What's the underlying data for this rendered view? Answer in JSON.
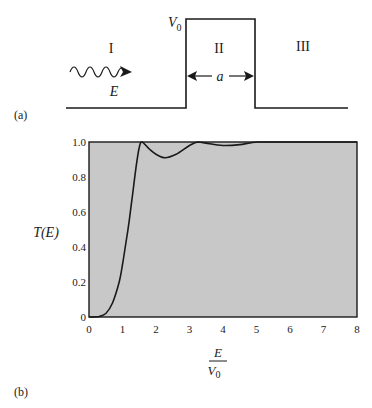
{
  "figure_a": {
    "panel_label": "(a)",
    "region_labels": [
      "I",
      "II",
      "III"
    ],
    "barrier_height_label": "V",
    "barrier_height_subscript": "0",
    "barrier_width_label": "a",
    "incident_energy_label": "E",
    "icons": {
      "incident_wave": "wavy-arrow-icon",
      "width_marker": "double-arrow-icon"
    }
  },
  "figure_b": {
    "panel_label": "(b)",
    "ylabel": "T(E)",
    "xlabel_numerator": "E",
    "xlabel_denominator": "V",
    "xlabel_denominator_subscript": "0",
    "plot_background": "#c8c8c8",
    "curve_color": "#1a1a1a"
  },
  "chart_data": {
    "type": "line",
    "title": "",
    "xlabel": "E/V0",
    "ylabel": "T(E)",
    "xlim": [
      0,
      8
    ],
    "ylim": [
      0,
      1.0
    ],
    "xticks": [
      "0",
      "1",
      "2",
      "3",
      "4",
      "5",
      "6",
      "7",
      "8"
    ],
    "yticks": [
      "0",
      "0.2",
      "0.4",
      "0.6",
      "0.8",
      "1.0"
    ],
    "grid": false,
    "legend": null,
    "series": [
      {
        "name": "T(E)",
        "x": [
          0,
          0.3,
          0.5,
          0.7,
          0.9,
          1.0,
          1.1,
          1.2,
          1.3,
          1.4,
          1.5,
          1.58,
          1.8,
          2.0,
          2.27,
          2.6,
          3.0,
          3.25,
          3.6,
          4.05,
          4.5,
          5.05,
          6.0,
          7.0,
          8.0
        ],
        "y": [
          0,
          0.003,
          0.02,
          0.08,
          0.2,
          0.3,
          0.42,
          0.55,
          0.7,
          0.85,
          0.97,
          1.0,
          0.96,
          0.93,
          0.91,
          0.93,
          0.98,
          1.0,
          0.99,
          0.98,
          0.985,
          1.0,
          1.0,
          1.0,
          1.0
        ]
      }
    ],
    "annotations": [
      "(a) rectangular potential barrier of height V0 and width a; regions I, II, III; incident wave with energy E",
      "(b)"
    ]
  }
}
